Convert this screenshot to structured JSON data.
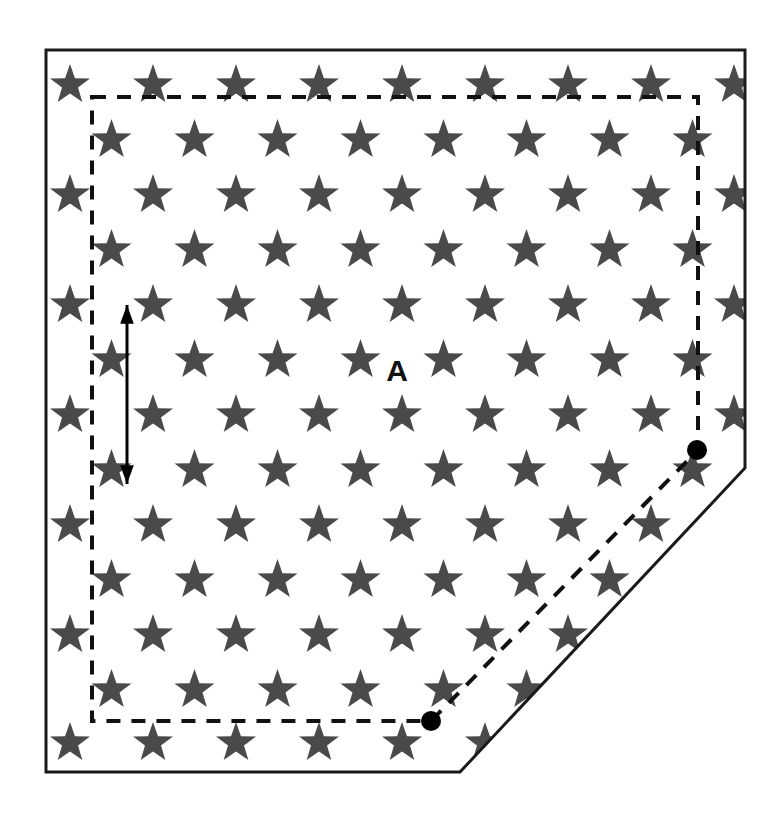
{
  "figure": {
    "background_color": "#ffffff",
    "width": 780,
    "height": 822
  },
  "labels": {
    "area_label": "A"
  },
  "colors": {
    "star_fill": "#4a4a4a",
    "outline_stroke": "#1a1a1a",
    "dashed_stroke": "#111111",
    "dot_fill": "#000000",
    "arrow_stroke": "#000000",
    "label_color": "#111111"
  },
  "field_outline": {
    "name": "solid-field-boundary",
    "shape": "pentagon",
    "stroke_width": 3,
    "dash": "none",
    "points": [
      [
        46,
        50
      ],
      [
        745,
        50
      ],
      [
        745,
        468
      ],
      [
        460,
        772
      ],
      [
        46,
        772
      ]
    ]
  },
  "inner_boundary": {
    "name": "dashed-inner-boundary",
    "shape": "pentagon",
    "stroke_width": 4,
    "dash": "14,11",
    "points": [
      [
        92,
        97
      ],
      [
        698,
        97
      ],
      [
        698,
        450
      ],
      [
        431,
        721
      ],
      [
        92,
        721
      ]
    ]
  },
  "markers": [
    {
      "name": "vertex-dot-upper-right",
      "x": 697,
      "y": 450,
      "r": 10
    },
    {
      "name": "vertex-dot-lower-left",
      "x": 431,
      "y": 721,
      "r": 10
    }
  ],
  "spacing_arrow": {
    "name": "row-spacing-arrow",
    "x": 127,
    "y_top": 305,
    "y_bottom": 484,
    "stroke_width": 3,
    "head_size": 11,
    "double_headed": true
  },
  "area_label_position": {
    "x": 397,
    "y": 381
  },
  "star_grid": {
    "star_radius": 21,
    "row_spacing": 55,
    "col_spacing": 83,
    "row_offset": 41.5,
    "origin_x": 70,
    "origin_y": 85,
    "rows": [
      {
        "index": 0,
        "y": 85,
        "offset": false,
        "count": 9
      },
      {
        "index": 1,
        "y": 140,
        "offset": true,
        "count": 8
      },
      {
        "index": 2,
        "y": 195,
        "offset": false,
        "count": 9
      },
      {
        "index": 3,
        "y": 250,
        "offset": true,
        "count": 8
      },
      {
        "index": 4,
        "y": 305,
        "offset": false,
        "count": 9
      },
      {
        "index": 5,
        "y": 360,
        "offset": true,
        "count": 8
      },
      {
        "index": 6,
        "y": 415,
        "offset": false,
        "count": 9
      },
      {
        "index": 7,
        "y": 470,
        "offset": true,
        "count": 8
      },
      {
        "index": 8,
        "y": 525,
        "offset": false,
        "count": 9
      },
      {
        "index": 9,
        "y": 580,
        "offset": true,
        "count": 8
      },
      {
        "index": 10,
        "y": 635,
        "offset": false,
        "count": 9
      },
      {
        "index": 11,
        "y": 690,
        "offset": true,
        "count": 8
      },
      {
        "index": 12,
        "y": 743,
        "offset": false,
        "count": 9
      }
    ]
  },
  "chart_data": {
    "type": "scatter",
    "xlabel": "",
    "ylabel": "",
    "grid": false,
    "legend": "none",
    "annotations": [
      "A"
    ],
    "series": [
      {
        "name": "stars",
        "marker": "star",
        "color": "#4a4a4a",
        "description": "Staggered grid of stars, 13 rows alternating 9 and 8 stars per row, clipped to pentagon field",
        "row_spacing": 55,
        "column_spacing": 83,
        "total_rows": 13
      }
    ]
  }
}
